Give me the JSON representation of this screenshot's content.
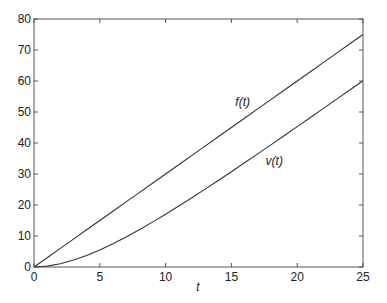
{
  "chart_data": {
    "type": "line",
    "title": "",
    "xlabel": "t",
    "ylabel": "",
    "xlim": [
      0,
      25
    ],
    "ylim": [
      0,
      80
    ],
    "grid": false,
    "legend": "none",
    "x_ticks": [
      0,
      5,
      10,
      15,
      20,
      25
    ],
    "y_ticks": [
      0,
      10,
      20,
      30,
      40,
      50,
      60,
      70,
      80
    ],
    "x": [
      0,
      1,
      2,
      3,
      4,
      5,
      6,
      7,
      8,
      9,
      10,
      11,
      12,
      13,
      14,
      15,
      16,
      17,
      18,
      19,
      20,
      21,
      22,
      23,
      24,
      25
    ],
    "series": [
      {
        "name": "f(t)",
        "label_pos": [
          15.3,
          52
        ],
        "color": "#333333",
        "values": [
          0,
          3,
          6,
          9,
          12,
          15,
          18,
          21,
          24,
          27,
          30,
          33,
          36,
          39,
          42,
          45,
          48,
          51,
          54,
          57,
          60,
          63,
          66,
          69,
          72,
          75
        ]
      },
      {
        "name": "v(t)",
        "label_pos": [
          17.6,
          33
        ],
        "color": "#333333",
        "values": [
          0,
          0.28,
          1.05,
          2.23,
          3.74,
          5.52,
          7.52,
          9.7,
          12.03,
          14.48,
          17.03,
          19.66,
          22.36,
          25.11,
          27.91,
          30.75,
          33.61,
          36.5,
          39.41,
          42.34,
          45.27,
          48.22,
          51.18,
          54.15,
          57.12,
          60.1
        ]
      }
    ]
  },
  "labels": {
    "xlabel": "t",
    "f_label": "f(t)",
    "v_label": "v(t)"
  }
}
